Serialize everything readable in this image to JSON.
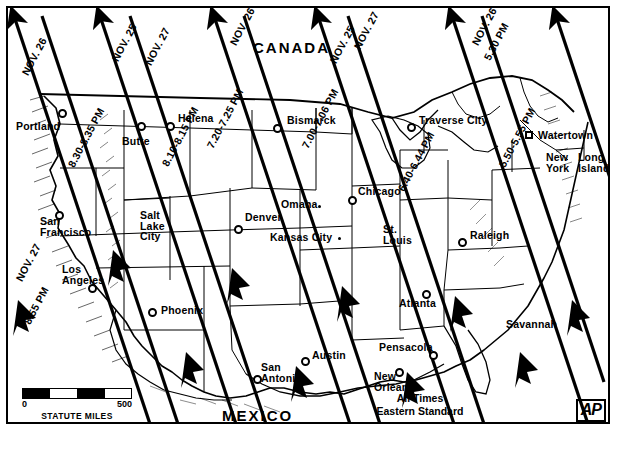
{
  "map": {
    "title": "Solar eclipse path map of the United States",
    "countries": [
      {
        "name": "CANADA",
        "x": 253,
        "y": 40
      },
      {
        "name": "MEXICO",
        "x": 222,
        "y": 408
      }
    ],
    "caption": {
      "line1": "All Times",
      "line2": "Eastern Standard"
    },
    "agency_logo": "AP",
    "scale": {
      "min": "0",
      "max": "500",
      "units": "STATUTE MILES"
    },
    "cities": [
      {
        "name": "Portland",
        "x": 16,
        "y": 121,
        "marker": {
          "type": "circle",
          "x": 58,
          "y": 109
        }
      },
      {
        "name": "Butte",
        "x": 122,
        "y": 136,
        "marker": {
          "type": "circle",
          "x": 137,
          "y": 122
        }
      },
      {
        "name": "Helena",
        "x": 178,
        "y": 113,
        "marker": {
          "type": "circle",
          "x": 166,
          "y": 122
        }
      },
      {
        "name": "Bismarck",
        "x": 287,
        "y": 115,
        "marker": {
          "type": "circle",
          "x": 273,
          "y": 124
        }
      },
      {
        "name": "Traverse City",
        "x": 419,
        "y": 115,
        "marker": {
          "type": "circle",
          "x": 407,
          "y": 123
        }
      },
      {
        "name": "Watertown",
        "x": 538,
        "y": 130,
        "marker": {
          "type": "square",
          "x": 525,
          "y": 131
        }
      },
      {
        "name": "New York",
        "x": 546,
        "y": 158,
        "marker": {
          "type": "none"
        }
      },
      {
        "name": "Long Island",
        "x": 578,
        "y": 158,
        "marker": {
          "type": "none"
        }
      },
      {
        "name": "San Francisco",
        "x": 40,
        "y": 222,
        "marker": {
          "type": "circle",
          "x": 55,
          "y": 211
        }
      },
      {
        "name": "Salt Lake City",
        "x": 140,
        "y": 215,
        "marker": {
          "type": "none"
        }
      },
      {
        "name": "Denver",
        "x": 245,
        "y": 212,
        "marker": {
          "type": "circle",
          "x": 234,
          "y": 225
        }
      },
      {
        "name": "Omaha",
        "x": 281,
        "y": 199,
        "marker": {
          "type": "tick",
          "x": 318,
          "y": 205
        }
      },
      {
        "name": "Chicago",
        "x": 358,
        "y": 186,
        "marker": {
          "type": "circle",
          "x": 348,
          "y": 196
        }
      },
      {
        "name": "Kansas City",
        "x": 270,
        "y": 238,
        "marker": {
          "type": "tick",
          "x": 338,
          "y": 237
        }
      },
      {
        "name": "St. Louis",
        "x": 383,
        "y": 228,
        "marker": {
          "type": "none"
        }
      },
      {
        "name": "Raleigh",
        "x": 470,
        "y": 230,
        "marker": {
          "type": "circle",
          "x": 458,
          "y": 238
        }
      },
      {
        "name": "Los Angeles",
        "x": 62,
        "y": 269,
        "marker": {
          "type": "circle",
          "x": 88,
          "y": 284
        }
      },
      {
        "name": "Phoenix",
        "x": 161,
        "y": 309,
        "marker": {
          "type": "circle",
          "x": 148,
          "y": 308
        }
      },
      {
        "name": "Atlanta",
        "x": 403,
        "y": 300,
        "marker": {
          "type": "circle",
          "x": 422,
          "y": 290
        }
      },
      {
        "name": "Savannah",
        "x": 508,
        "y": 322,
        "marker": {
          "type": "none"
        }
      },
      {
        "name": "Austin",
        "x": 312,
        "y": 350,
        "marker": {
          "type": "circle",
          "x": 301,
          "y": 357
        }
      },
      {
        "name": "Pensacola",
        "x": 381,
        "y": 344,
        "marker": {
          "type": "circle",
          "x": 429,
          "y": 351
        }
      },
      {
        "name": "San Antonio",
        "x": 263,
        "y": 364,
        "marker": {
          "type": "circle",
          "x": 253,
          "y": 375
        }
      },
      {
        "name": "New Orleans",
        "x": 376,
        "y": 375,
        "marker": {
          "type": "circle",
          "x": 395,
          "y": 368
        }
      }
    ],
    "path_labels": [
      {
        "text": "NOV. 26",
        "x": 20,
        "y": 72,
        "rot": -62
      },
      {
        "text": "NOV. 25",
        "x": 110,
        "y": 58,
        "rot": -62
      },
      {
        "text": "NOV. 27",
        "x": 143,
        "y": 62,
        "rot": -62
      },
      {
        "text": "NOV. 26",
        "x": 228,
        "y": 42,
        "rot": -62
      },
      {
        "text": "NOV. 25",
        "x": 328,
        "y": 60,
        "rot": -62
      },
      {
        "text": "NOV. 27",
        "x": 350,
        "y": 48,
        "rot": -62
      },
      {
        "text": "NOV. 26",
        "x": 470,
        "y": 42,
        "rot": -62
      },
      {
        "text": "NOV. 27",
        "x": 14,
        "y": 278,
        "rot": -62
      }
    ],
    "time_labels": [
      {
        "text": "8.30-8.35 PM",
        "x": 66,
        "y": 164,
        "rot": -62
      },
      {
        "text": "8.10-8.15 PM",
        "x": 160,
        "y": 163,
        "rot": -62
      },
      {
        "text": "7.20-7.25 PM",
        "x": 205,
        "y": 145,
        "rot": -62
      },
      {
        "text": "7.00-7.06 PM",
        "x": 300,
        "y": 145,
        "rot": -62
      },
      {
        "text": "6.40-6.44 PM",
        "x": 396,
        "y": 188,
        "rot": -62
      },
      {
        "text": "5.50-5.55 PM",
        "x": 497,
        "y": 164,
        "rot": -62
      },
      {
        "text": "5.30 PM",
        "x": 482,
        "y": 57,
        "rot": -62
      },
      {
        "text": "8.55 PM",
        "x": 22,
        "y": 321,
        "rot": -62
      }
    ]
  }
}
